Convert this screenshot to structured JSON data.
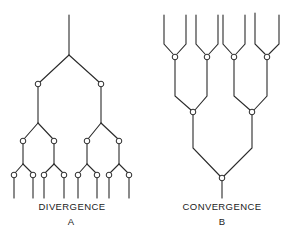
{
  "figure": {
    "panel_a": {
      "title": "DIVERGENCE",
      "letter": "A",
      "structure": "binary tree branching downward from single trunk into 8 outputs",
      "levels": [
        1,
        2,
        4,
        8
      ]
    },
    "panel_b": {
      "title": "CONVERGENCE",
      "letter": "B",
      "structure": "8 inputs merging pairwise downward into single output",
      "levels": [
        8,
        4,
        2,
        1
      ]
    },
    "colors": {
      "line": "#2a2a2a",
      "background": "#ffffff"
    }
  }
}
